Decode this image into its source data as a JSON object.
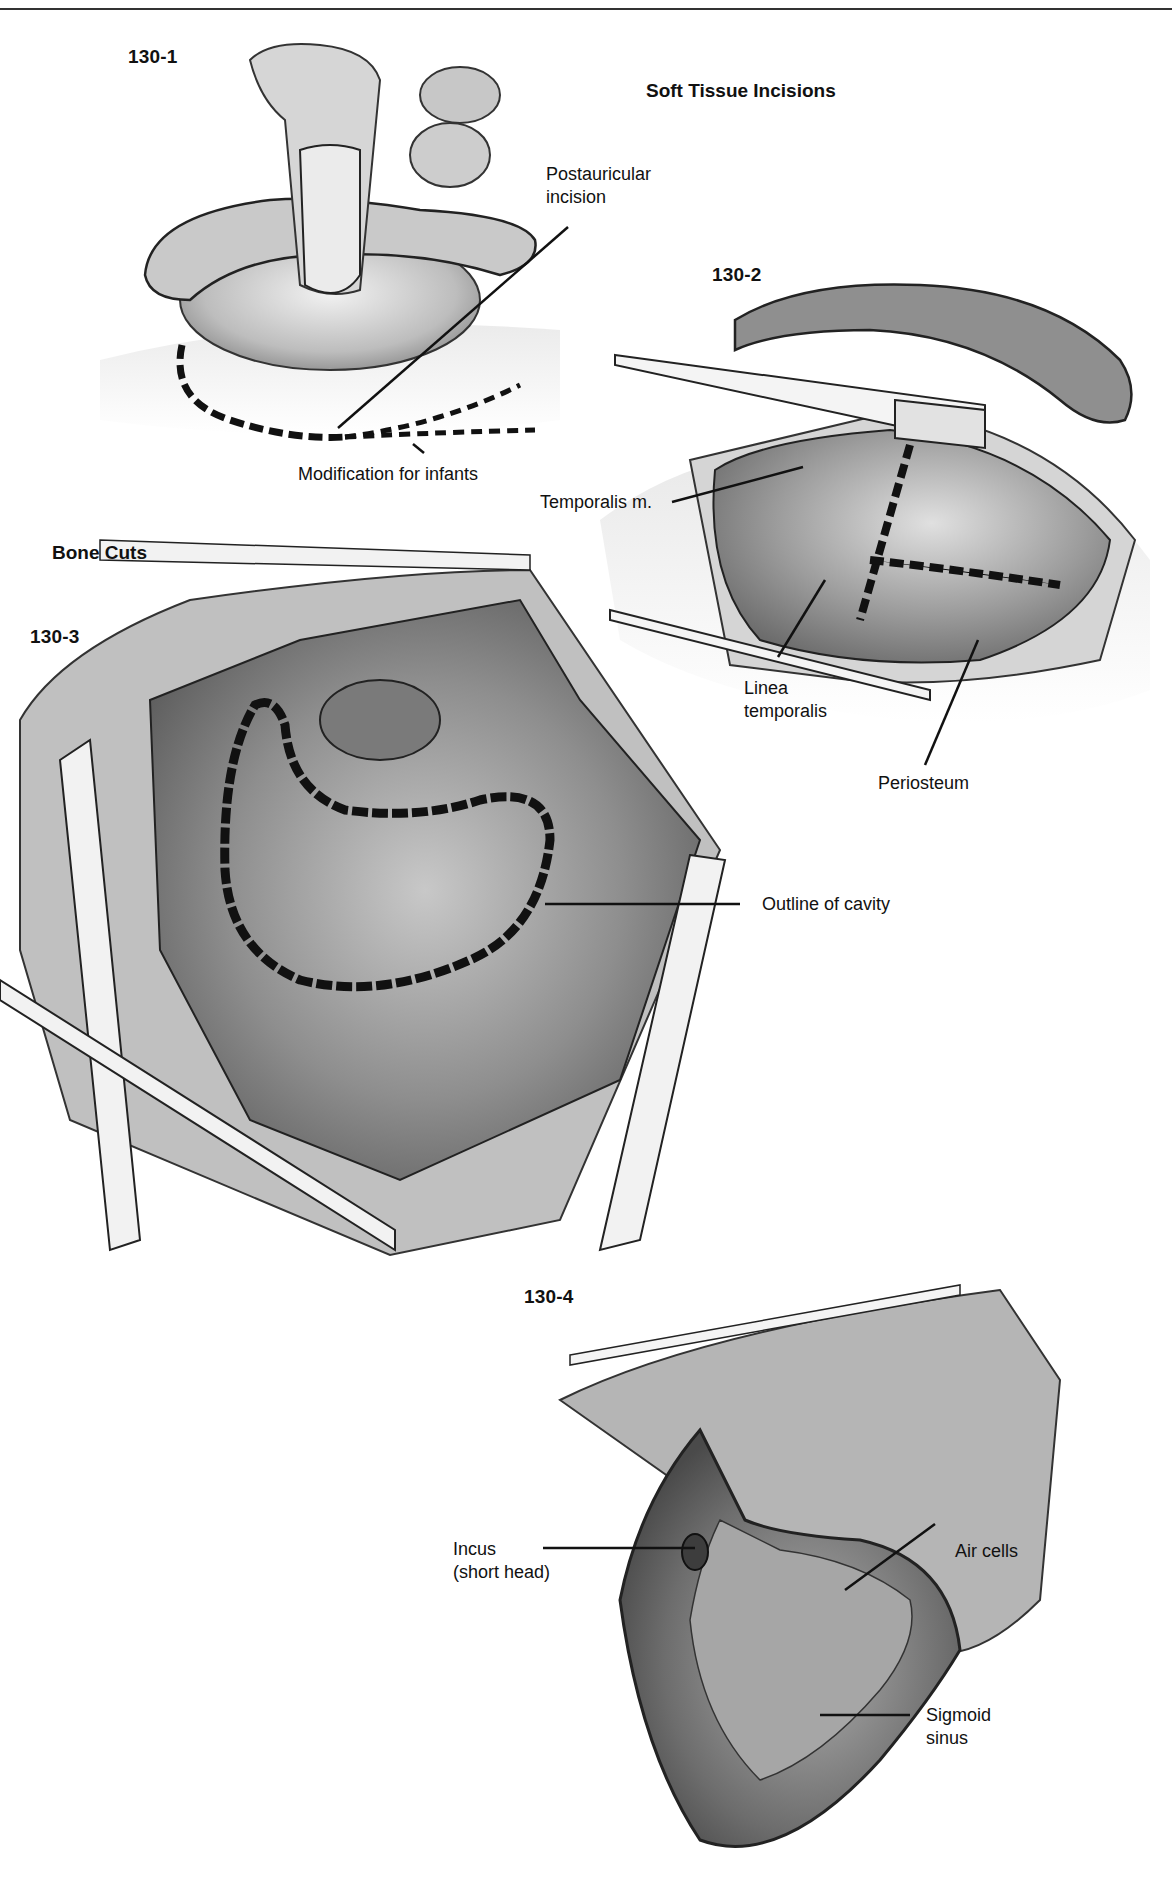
{
  "page": {
    "header_fragment": "p                    y"
  },
  "sections": {
    "soft_tissue": "Soft Tissue Incisions",
    "bone_cuts": "Bone Cuts"
  },
  "figures": [
    {
      "id": "130-1",
      "labels": [
        "Postauricular incision",
        "Modification for infants"
      ]
    },
    {
      "id": "130-2",
      "labels": [
        "Temporalis m.",
        "Linea temporalis",
        "Periosteum"
      ]
    },
    {
      "id": "130-3",
      "labels": [
        "Outline of cavity"
      ]
    },
    {
      "id": "130-4",
      "labels": [
        "Incus (short head)",
        "Air cells",
        "Sigmoid sinus"
      ]
    }
  ],
  "labels": {
    "postauricular_l1": "Postauricular",
    "postauricular_l2": "incision",
    "infants": "Modification for infants",
    "temporalis": "Temporalis m.",
    "linea_l1": "Linea",
    "linea_l2": "temporalis",
    "periosteum": "Periosteum",
    "outline": "Outline of cavity",
    "incus_l1": "Incus",
    "incus_l2": "(short head)",
    "air_cells": "Air cells",
    "sigmoid_l1": "Sigmoid",
    "sigmoid_l2": "sinus"
  },
  "colors": {
    "ink": "#111111",
    "paper": "#ffffff",
    "shade_dark": "#6a6a6a",
    "shade_mid": "#9a9a9a",
    "shade_light": "#cfcfcf"
  }
}
